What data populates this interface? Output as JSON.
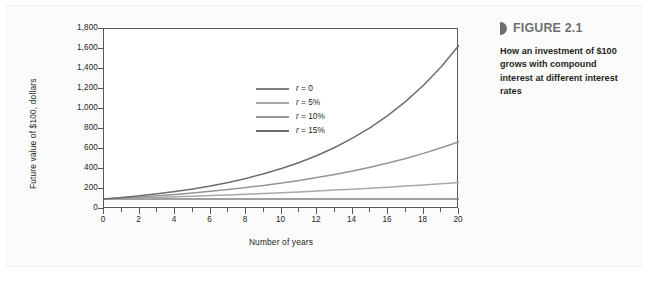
{
  "figure": {
    "marker_icon": "figure-marker-icon",
    "label": "FIGURE 2.1",
    "caption": "How an investment of $100 grows with compound interest at different interest rates"
  },
  "chart_data": {
    "type": "line",
    "title": "",
    "xlabel": "Number of years",
    "ylabel": "Future value of $100, dollars",
    "xlim": [
      0,
      20
    ],
    "ylim": [
      0,
      1800
    ],
    "grid": false,
    "legend_position": "upper-left-inside",
    "x_tick_labels": [
      "0",
      "2",
      "4",
      "6",
      "8",
      "10",
      "12",
      "14",
      "16",
      "18",
      "20"
    ],
    "x_ticks": [
      0,
      2,
      4,
      6,
      8,
      10,
      12,
      14,
      16,
      18,
      20
    ],
    "x_minor_ticks": [
      1,
      3,
      5,
      7,
      9,
      11,
      13,
      15,
      17,
      19
    ],
    "y_tick_labels": [
      "0",
      "200",
      "400",
      "600",
      "800",
      "1,000",
      "1,200",
      "1,400",
      "1,600",
      "1,800"
    ],
    "y_ticks": [
      0,
      200,
      400,
      600,
      800,
      1000,
      1200,
      1400,
      1600,
      1800
    ],
    "x": [
      0,
      1,
      2,
      3,
      4,
      5,
      6,
      7,
      8,
      9,
      10,
      11,
      12,
      13,
      14,
      15,
      16,
      17,
      18,
      19,
      20
    ],
    "series": [
      {
        "name": "r = 0",
        "label_prefix": "r",
        "label_value": "= 0",
        "rate": 0.0,
        "color": "#7f8082",
        "values": [
          100,
          100,
          100,
          100,
          100,
          100,
          100,
          100,
          100,
          100,
          100,
          100,
          100,
          100,
          100,
          100,
          100,
          100,
          100,
          100,
          100
        ]
      },
      {
        "name": "r = 5%",
        "label_prefix": "r",
        "label_value": "= 5%",
        "rate": 0.05,
        "color": "#a7a9ac",
        "values": [
          100,
          105,
          110,
          116,
          122,
          128,
          134,
          141,
          148,
          155,
          163,
          171,
          180,
          189,
          198,
          208,
          218,
          229,
          241,
          253,
          265
        ]
      },
      {
        "name": "r = 10%",
        "label_prefix": "r",
        "label_value": "= 10%",
        "rate": 0.1,
        "color": "#939598",
        "values": [
          100,
          110,
          121,
          133,
          146,
          161,
          177,
          195,
          214,
          236,
          259,
          285,
          314,
          345,
          380,
          418,
          459,
          505,
          556,
          612,
          673
        ]
      },
      {
        "name": "r = 15%",
        "label_prefix": "r",
        "label_value": "= 15%",
        "rate": 0.15,
        "color": "#6d6e71",
        "values": [
          100,
          115,
          132,
          152,
          175,
          201,
          231,
          266,
          306,
          352,
          405,
          465,
          535,
          615,
          708,
          814,
          936,
          1076,
          1238,
          1423,
          1637
        ]
      }
    ]
  }
}
